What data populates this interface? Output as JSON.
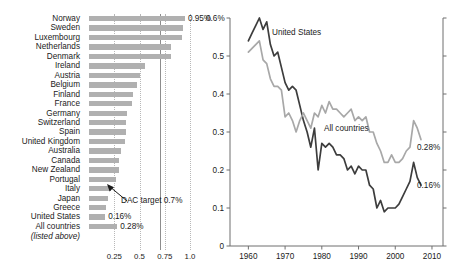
{
  "chart_data": [
    {
      "type": "bar",
      "orientation": "horizontal",
      "title": "",
      "xlabel": "",
      "ylabel": "",
      "xlim": [
        0,
        1.12
      ],
      "grid": true,
      "xticks": [
        "0.25",
        "0.5",
        "0.75",
        "1.0"
      ],
      "xtick_values": [
        0.25,
        0.5,
        0.75,
        1.0
      ],
      "categories": [
        "Norway",
        "Sweden",
        "Luxembourg",
        "Netherlands",
        "Denmark",
        "Ireland",
        "Austria",
        "Belgium",
        "Finland",
        "France",
        "Germany",
        "Switzerland",
        "Spain",
        "United Kingdom",
        "Australia",
        "Canada",
        "New Zealand",
        "Portugal",
        "Italy",
        "Japan",
        "Greece",
        "United States",
        "All countries"
      ],
      "values": [
        0.95,
        0.93,
        0.92,
        0.81,
        0.81,
        0.55,
        0.5,
        0.48,
        0.44,
        0.43,
        0.38,
        0.37,
        0.37,
        0.36,
        0.32,
        0.3,
        0.3,
        0.27,
        0.22,
        0.19,
        0.17,
        0.16,
        0.28
      ],
      "data_labels": {
        "Norway": "0.95%",
        "United States": "0.16%",
        "All countries": "0.28%"
      },
      "sublabel": "(listed above)",
      "annotation": {
        "text": "DAC target 0.7%",
        "value": 0.7
      },
      "bar_color": "#b0b0b0",
      "gridline_color": "#b8b8b8",
      "target_line_color": "#8d8d8d"
    },
    {
      "type": "line",
      "title": "",
      "xlabel": "",
      "ylabel": "",
      "xlim": [
        1955,
        2013
      ],
      "ylim": [
        0,
        0.6
      ],
      "grid": false,
      "xticks": [
        "1960",
        "1970",
        "1980",
        "1990",
        "2000",
        "2010"
      ],
      "xtick_values": [
        1960,
        1970,
        1980,
        1990,
        2000,
        2010
      ],
      "yticks": [
        "0.6%",
        "0.5",
        "0.4",
        "0.3",
        "0.2",
        "0.1",
        "0"
      ],
      "ytick_values": [
        0.6,
        0.5,
        0.4,
        0.3,
        0.2,
        0.1,
        0
      ],
      "legend_position": "inline-labels",
      "series": [
        {
          "name": "United States",
          "color": "#3d3d3d",
          "end_label": "0.16%",
          "x": [
            1960,
            1961,
            1962,
            1963,
            1964,
            1965,
            1966,
            1967,
            1968,
            1969,
            1970,
            1971,
            1972,
            1973,
            1974,
            1975,
            1976,
            1977,
            1978,
            1979,
            1980,
            1981,
            1982,
            1983,
            1984,
            1985,
            1986,
            1987,
            1988,
            1989,
            1990,
            1991,
            1992,
            1993,
            1994,
            1995,
            1996,
            1997,
            1998,
            1999,
            2000,
            2001,
            2002,
            2003,
            2004,
            2005,
            2006,
            2007
          ],
          "values": [
            0.54,
            0.56,
            0.58,
            0.6,
            0.57,
            0.59,
            0.53,
            0.5,
            0.51,
            0.47,
            0.43,
            0.41,
            0.42,
            0.41,
            0.37,
            0.33,
            0.3,
            0.26,
            0.31,
            0.2,
            0.27,
            0.26,
            0.27,
            0.26,
            0.24,
            0.24,
            0.23,
            0.2,
            0.21,
            0.19,
            0.21,
            0.2,
            0.2,
            0.16,
            0.15,
            0.1,
            0.12,
            0.09,
            0.1,
            0.1,
            0.1,
            0.11,
            0.13,
            0.15,
            0.17,
            0.22,
            0.18,
            0.16
          ]
        },
        {
          "name": "All countries",
          "color": "#a8a8a8",
          "end_label": "0.28%",
          "x": [
            1960,
            1961,
            1962,
            1963,
            1964,
            1965,
            1966,
            1967,
            1968,
            1969,
            1970,
            1971,
            1972,
            1973,
            1974,
            1975,
            1976,
            1977,
            1978,
            1979,
            1980,
            1981,
            1982,
            1983,
            1984,
            1985,
            1986,
            1987,
            1988,
            1989,
            1990,
            1991,
            1992,
            1993,
            1994,
            1995,
            1996,
            1997,
            1998,
            1999,
            2000,
            2001,
            2002,
            2003,
            2004,
            2005,
            2006,
            2007
          ],
          "values": [
            0.51,
            0.52,
            0.53,
            0.54,
            0.49,
            0.48,
            0.44,
            0.42,
            0.42,
            0.41,
            0.34,
            0.35,
            0.33,
            0.3,
            0.33,
            0.35,
            0.33,
            0.31,
            0.35,
            0.34,
            0.37,
            0.35,
            0.38,
            0.36,
            0.36,
            0.35,
            0.34,
            0.35,
            0.36,
            0.33,
            0.34,
            0.33,
            0.34,
            0.3,
            0.3,
            0.27,
            0.25,
            0.22,
            0.22,
            0.24,
            0.22,
            0.22,
            0.23,
            0.25,
            0.26,
            0.33,
            0.31,
            0.28
          ]
        }
      ]
    }
  ],
  "bar_chart": {
    "rows": [
      {
        "label": "Norway",
        "value": 0.95,
        "value_label": "0.95%"
      },
      {
        "label": "Sweden",
        "value": 0.93,
        "value_label": ""
      },
      {
        "label": "Luxembourg",
        "value": 0.92,
        "value_label": ""
      },
      {
        "label": "Netherlands",
        "value": 0.81,
        "value_label": ""
      },
      {
        "label": "Denmark",
        "value": 0.81,
        "value_label": ""
      },
      {
        "label": "Ireland",
        "value": 0.55,
        "value_label": ""
      },
      {
        "label": "Austria",
        "value": 0.5,
        "value_label": ""
      },
      {
        "label": "Belgium",
        "value": 0.48,
        "value_label": ""
      },
      {
        "label": "Finland",
        "value": 0.44,
        "value_label": ""
      },
      {
        "label": "France",
        "value": 0.43,
        "value_label": ""
      },
      {
        "label": "Germany",
        "value": 0.38,
        "value_label": ""
      },
      {
        "label": "Switzerland",
        "value": 0.37,
        "value_label": ""
      },
      {
        "label": "Spain",
        "value": 0.37,
        "value_label": ""
      },
      {
        "label": "United Kingdom",
        "value": 0.36,
        "value_label": ""
      },
      {
        "label": "Australia",
        "value": 0.32,
        "value_label": ""
      },
      {
        "label": "Canada",
        "value": 0.3,
        "value_label": ""
      },
      {
        "label": "New Zealand",
        "value": 0.3,
        "value_label": ""
      },
      {
        "label": "Portugal",
        "value": 0.27,
        "value_label": ""
      },
      {
        "label": "Italy",
        "value": 0.22,
        "value_label": ""
      },
      {
        "label": "Japan",
        "value": 0.19,
        "value_label": ""
      },
      {
        "label": "Greece",
        "value": 0.17,
        "value_label": ""
      },
      {
        "label": "United States",
        "value": 0.16,
        "value_label": "0.16%"
      },
      {
        "label": "All countries",
        "value": 0.28,
        "value_label": "0.28%"
      }
    ],
    "sublabel": "(listed above)",
    "xticks": [
      "0.25",
      "0.5",
      "0.75",
      "1.0"
    ],
    "dac_annotation": "DAC target 0.7%"
  },
  "line_chart": {
    "yticks": [
      "0.6%",
      "0.5",
      "0.4",
      "0.3",
      "0.2",
      "0.1",
      "0"
    ],
    "xticks": [
      "1960",
      "1970",
      "1980",
      "1990",
      "2000",
      "2010"
    ],
    "series_labels": {
      "us": "United States",
      "all": "All countries"
    },
    "end_labels": {
      "us": "0.16%",
      "all": "0.28%"
    }
  },
  "colors": {
    "bar": "#b0b0b0",
    "us_line": "#3d3d3d",
    "all_line": "#a8a8a8",
    "gridline": "#b8b8b8",
    "axis": "#6f6f6f"
  }
}
